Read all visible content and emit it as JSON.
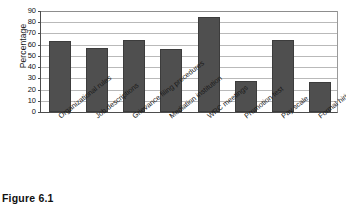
{
  "figure": {
    "caption": "Figure 6.1"
  },
  "chart_data": {
    "type": "bar",
    "title": "",
    "xlabel": "",
    "ylabel": "Percentage",
    "ylim": [
      0,
      90
    ],
    "ytick_step": 10,
    "yticks": [
      "90",
      "80",
      "70",
      "60",
      "50",
      "40",
      "30",
      "20",
      "10",
      "0"
    ],
    "grid": true,
    "legend": "none",
    "categories": [
      "Organizational rules",
      "Job descriptions",
      "Grievance filing procedures",
      "Mediation institution",
      "WRC meetings",
      "Promotion test",
      "Pay scale",
      "Formal hiring procedures"
    ],
    "values": [
      63,
      57,
      64,
      56,
      85,
      28,
      64,
      27
    ],
    "bar_color": "#4f4f4f",
    "grid_color": "#b9b9b9",
    "axis_color": "#4d4d4d"
  }
}
